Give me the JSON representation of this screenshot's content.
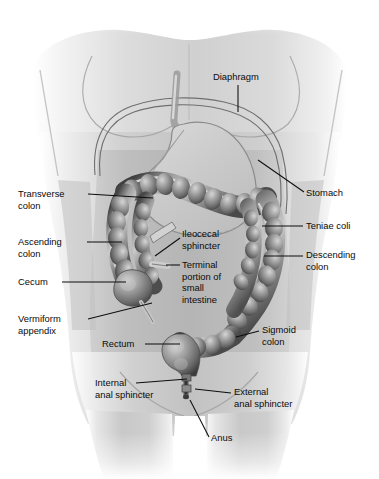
{
  "figure": {
    "background_color": "#ffffff",
    "body_fill_color": "#b9b9b9",
    "colon_color": "#6e6e6e",
    "stomach_color": "#c9c9c9",
    "label_color": "#0b0b0b",
    "leader_color": "#0d0d0d"
  },
  "labels": [
    {
      "id": "diaphragm",
      "lines": [
        "Diaphragm"
      ],
      "text_x": 213,
      "text_y": 80,
      "anchor": "start",
      "leader": "M 238 85 L 238 112"
    },
    {
      "id": "stomach",
      "lines": [
        "Stomach"
      ],
      "text_x": 306,
      "text_y": 196,
      "anchor": "start",
      "leader": "M 304 192 L 258 160"
    },
    {
      "id": "teniae-coli",
      "lines": [
        "Teniae coli"
      ],
      "text_x": 306,
      "text_y": 229,
      "anchor": "start",
      "leader": "M 303 226 L 262 226"
    },
    {
      "id": "descending-colon",
      "lines": [
        "Descending",
        "colon"
      ],
      "text_x": 306,
      "text_y": 258,
      "anchor": "start",
      "leader": "M 303 256 L 264 256"
    },
    {
      "id": "sigmoid-colon",
      "lines": [
        "Sigmoid",
        "colon"
      ],
      "text_x": 262,
      "text_y": 333,
      "anchor": "start",
      "leader": "M 259 331 L 236 337"
    },
    {
      "id": "external-anal-sphincter",
      "lines": [
        "External",
        "anal sphincter"
      ],
      "text_x": 234,
      "text_y": 395,
      "anchor": "start",
      "leader": "M 231 393 L 195 389"
    },
    {
      "id": "anus",
      "lines": [
        "Anus"
      ],
      "text_x": 211,
      "text_y": 441,
      "anchor": "start",
      "leader": "M 209 437 L 190 400"
    },
    {
      "id": "transverse-colon",
      "lines": [
        "Transverse",
        "colon"
      ],
      "text_x": 18,
      "text_y": 197,
      "anchor": "start",
      "leader": "M 88 194 L 153 198"
    },
    {
      "id": "ascending-colon",
      "lines": [
        "Ascending",
        "colon"
      ],
      "text_x": 18,
      "text_y": 245,
      "anchor": "start",
      "leader": "M 87 242 L 122 242"
    },
    {
      "id": "cecum",
      "lines": [
        "Cecum"
      ],
      "text_x": 18,
      "text_y": 285,
      "anchor": "start",
      "leader": "M 62 282 L 126 282"
    },
    {
      "id": "vermiform-appendix",
      "lines": [
        "Vermiform",
        "appendix"
      ],
      "text_x": 18,
      "text_y": 322,
      "anchor": "start",
      "leader": "M 88 319 L 152 303"
    },
    {
      "id": "rectum",
      "lines": [
        "Rectum"
      ],
      "text_x": 102,
      "text_y": 347,
      "anchor": "start",
      "leader": "M 145 344 L 180 344"
    },
    {
      "id": "internal-anal-sphincter",
      "lines": [
        "Internal",
        "anal sphincter"
      ],
      "text_x": 95,
      "text_y": 386,
      "anchor": "start",
      "leader": "M 136 383 L 187 379"
    },
    {
      "id": "ileocecal-sphincter",
      "lines": [
        "Ileocecal",
        "sphincter"
      ],
      "text_x": 182,
      "text_y": 237,
      "anchor": "start",
      "leader": "M 180 238 L 155 256"
    },
    {
      "id": "terminal-portion-small-intestine",
      "lines": [
        "Terminal",
        "portion of",
        "small",
        "intestine"
      ],
      "text_x": 182,
      "text_y": 268,
      "anchor": "start",
      "leader": "M 180 265 L 166 265"
    }
  ]
}
